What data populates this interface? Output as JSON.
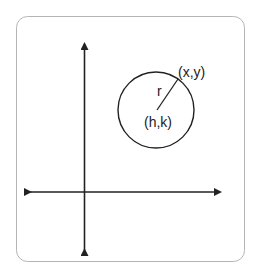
{
  "diagram": {
    "labels": {
      "point_on_circle": "(x,y)",
      "radius": "r",
      "center": "(h,k)"
    },
    "colors": {
      "stroke": "#222222",
      "frame": "#b5b5b5",
      "background": "#ffffff"
    }
  }
}
